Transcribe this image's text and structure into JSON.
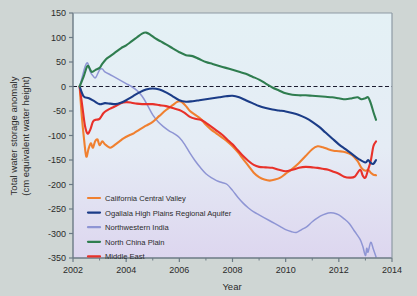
{
  "chart_data": {
    "type": "line",
    "title": "",
    "xlabel": "Year",
    "ylabel": "Total water storage anomaly (cm equivalent water height)",
    "ylabel_line1": "Total water storage anomaly",
    "ylabel_line2": "(cm equivalent water height)",
    "xlim": [
      2002,
      2014
    ],
    "ylim": [
      -350,
      150
    ],
    "xticks": [
      2002,
      2004,
      2006,
      2008,
      2010,
      2012,
      2014
    ],
    "xtick_labels": [
      "2002",
      "2004",
      "2006",
      "2008",
      "2010",
      "2012",
      "2014"
    ],
    "yticks": [
      150,
      100,
      50,
      0,
      -50,
      -100,
      -150,
      -200,
      -250,
      -300,
      -350
    ],
    "ytick_labels": [
      "150",
      "100",
      "50",
      "0",
      "-50",
      "-100",
      "-150",
      "-200",
      "-250",
      "-300",
      "-350"
    ],
    "grid": false,
    "zero_reference_line": {
      "value": 0,
      "style": "dashed",
      "color": "#1a1a2e"
    },
    "legend_position": "lower-left-inside",
    "series": [
      {
        "name": "California Central Valley",
        "color": "#f08030",
        "x": [
          2002.25,
          2002.33,
          2002.42,
          2002.5,
          2002.58,
          2002.67,
          2002.75,
          2002.83,
          2002.92,
          2003.0,
          2003.1,
          2003.2,
          2003.3,
          2003.4,
          2003.5,
          2003.6,
          2003.75,
          2003.9,
          2004.1,
          2004.3,
          2004.5,
          2004.75,
          2005.0,
          2005.25,
          2005.5,
          2005.75,
          2005.9,
          2006.0,
          2006.1,
          2006.25,
          2006.4,
          2006.6,
          2006.8,
          2007.0,
          2007.2,
          2007.4,
          2007.6,
          2007.8,
          2008.0,
          2008.2,
          2008.4,
          2008.6,
          2008.8,
          2009.0,
          2009.2,
          2009.4,
          2009.6,
          2009.8,
          2010.0,
          2010.25,
          2010.5,
          2010.75,
          2011.0,
          2011.2,
          2011.4,
          2011.6,
          2011.8,
          2012.0,
          2012.25,
          2012.5,
          2012.7,
          2012.85,
          2013.0,
          2013.1,
          2013.2,
          2013.3,
          2013.4
        ],
        "y": [
          0,
          -60,
          -110,
          -143,
          -128,
          -116,
          -125,
          -112,
          -108,
          -120,
          -112,
          -118,
          -122,
          -125,
          -122,
          -118,
          -112,
          -106,
          -100,
          -95,
          -88,
          -80,
          -72,
          -60,
          -48,
          -38,
          -32,
          -30,
          -32,
          -40,
          -50,
          -58,
          -66,
          -78,
          -88,
          -96,
          -104,
          -112,
          -122,
          -134,
          -148,
          -162,
          -176,
          -185,
          -190,
          -192,
          -190,
          -186,
          -178,
          -168,
          -156,
          -142,
          -128,
          -122,
          -124,
          -128,
          -131,
          -132,
          -134,
          -140,
          -152,
          -166,
          -172,
          -170,
          -176,
          -180,
          -181
        ]
      },
      {
        "name": "Ogallala High Plains Regional Aquifer",
        "color": "#1b3c87",
        "x": [
          2002.25,
          2002.4,
          2002.6,
          2002.8,
          2003.0,
          2003.2,
          2003.4,
          2003.6,
          2003.8,
          2004.0,
          2004.25,
          2004.5,
          2004.75,
          2005.0,
          2005.25,
          2005.5,
          2005.75,
          2006.0,
          2006.25,
          2006.5,
          2006.75,
          2007.0,
          2007.25,
          2007.5,
          2007.75,
          2008.0,
          2008.25,
          2008.5,
          2008.75,
          2009.0,
          2009.25,
          2009.5,
          2009.75,
          2010.0,
          2010.25,
          2010.5,
          2010.75,
          2011.0,
          2011.25,
          2011.5,
          2011.75,
          2012.0,
          2012.25,
          2012.5,
          2012.75,
          2013.0,
          2013.1,
          2013.2,
          2013.3,
          2013.4
        ],
        "y": [
          0,
          -20,
          -24,
          -30,
          -36,
          -34,
          -35,
          -36,
          -33,
          -28,
          -20,
          -12,
          -6,
          -4,
          -6,
          -12,
          -20,
          -28,
          -31,
          -30,
          -28,
          -26,
          -24,
          -22,
          -20,
          -19,
          -22,
          -28,
          -34,
          -40,
          -44,
          -47,
          -49,
          -51,
          -54,
          -58,
          -64,
          -72,
          -82,
          -94,
          -106,
          -118,
          -128,
          -138,
          -148,
          -155,
          -150,
          -156,
          -158,
          -150
        ]
      },
      {
        "name": "Northwestern India",
        "color": "#8e95d4",
        "x": [
          2002.25,
          2002.35,
          2002.45,
          2002.55,
          2002.65,
          2002.75,
          2002.85,
          2003.0,
          2003.1,
          2003.2,
          2003.4,
          2003.6,
          2003.8,
          2004.0,
          2004.2,
          2004.4,
          2004.6,
          2004.8,
          2005.0,
          2005.2,
          2005.4,
          2005.6,
          2005.8,
          2006.0,
          2006.2,
          2006.4,
          2006.6,
          2006.8,
          2007.0,
          2007.2,
          2007.4,
          2007.6,
          2007.8,
          2008.0,
          2008.2,
          2008.4,
          2008.6,
          2008.8,
          2009.0,
          2009.2,
          2009.4,
          2009.6,
          2009.8,
          2010.0,
          2010.2,
          2010.4,
          2010.6,
          2010.8,
          2011.0,
          2011.2,
          2011.4,
          2011.6,
          2011.8,
          2012.0,
          2012.2,
          2012.4,
          2012.6,
          2012.8,
          2012.9,
          2013.0,
          2013.05,
          2013.1,
          2013.2,
          2013.3,
          2013.4
        ],
        "y": [
          0,
          20,
          40,
          48,
          30,
          22,
          18,
          34,
          36,
          30,
          24,
          18,
          12,
          6,
          0,
          -8,
          -20,
          -38,
          -58,
          -72,
          -82,
          -90,
          -96,
          -104,
          -118,
          -136,
          -152,
          -166,
          -178,
          -186,
          -192,
          -196,
          -200,
          -212,
          -226,
          -238,
          -248,
          -256,
          -262,
          -268,
          -274,
          -280,
          -286,
          -292,
          -296,
          -298,
          -292,
          -286,
          -276,
          -268,
          -262,
          -258,
          -258,
          -262,
          -270,
          -280,
          -296,
          -312,
          -326,
          -345,
          -330,
          -338,
          -318,
          -332,
          -348
        ]
      },
      {
        "name": "North China Plain",
        "color": "#2f7d4f",
        "x": [
          2002.25,
          2002.4,
          2002.55,
          2002.7,
          2002.85,
          2003.0,
          2003.1,
          2003.25,
          2003.4,
          2003.6,
          2003.8,
          2004.0,
          2004.2,
          2004.4,
          2004.6,
          2004.75,
          2004.9,
          2005.1,
          2005.3,
          2005.5,
          2005.75,
          2006.0,
          2006.25,
          2006.5,
          2006.75,
          2007.0,
          2007.25,
          2007.5,
          2007.75,
          2008.0,
          2008.25,
          2008.5,
          2008.75,
          2009.0,
          2009.25,
          2009.5,
          2009.75,
          2010.0,
          2010.25,
          2010.5,
          2010.75,
          2011.0,
          2011.25,
          2011.5,
          2011.75,
          2012.0,
          2012.25,
          2012.5,
          2012.7,
          2012.85,
          2013.0,
          2013.1,
          2013.2,
          2013.3,
          2013.4
        ],
        "y": [
          0,
          20,
          42,
          30,
          34,
          38,
          46,
          56,
          62,
          70,
          78,
          84,
          92,
          100,
          108,
          110,
          106,
          98,
          92,
          86,
          78,
          70,
          64,
          62,
          56,
          50,
          46,
          42,
          38,
          34,
          30,
          26,
          20,
          14,
          6,
          -2,
          -8,
          -14,
          -17,
          -18,
          -18,
          -19,
          -20,
          -21,
          -22,
          -24,
          -26,
          -24,
          -22,
          -26,
          -24,
          -22,
          -34,
          -52,
          -68
        ]
      },
      {
        "name": "Middle East",
        "color": "#e8312a",
        "x": [
          2002.25,
          2002.35,
          2002.45,
          2002.55,
          2002.65,
          2002.75,
          2002.85,
          2003.0,
          2003.15,
          2003.3,
          2003.45,
          2003.6,
          2003.8,
          2004.0,
          2004.2,
          2004.4,
          2004.6,
          2004.8,
          2005.0,
          2005.25,
          2005.5,
          2005.75,
          2006.0,
          2006.2,
          2006.4,
          2006.6,
          2006.8,
          2007.0,
          2007.2,
          2007.4,
          2007.6,
          2007.8,
          2008.0,
          2008.2,
          2008.4,
          2008.6,
          2008.8,
          2009.0,
          2009.25,
          2009.5,
          2009.75,
          2010.0,
          2010.25,
          2010.5,
          2010.75,
          2011.0,
          2011.2,
          2011.4,
          2011.6,
          2011.8,
          2012.0,
          2012.2,
          2012.4,
          2012.6,
          2012.8,
          2012.9,
          2013.0,
          2013.1,
          2013.2,
          2013.3,
          2013.4
        ],
        "y": [
          0,
          -40,
          -80,
          -96,
          -88,
          -72,
          -68,
          -66,
          -54,
          -48,
          -44,
          -40,
          -34,
          -32,
          -33,
          -35,
          -36,
          -36,
          -36,
          -38,
          -40,
          -44,
          -48,
          -54,
          -62,
          -66,
          -68,
          -74,
          -82,
          -90,
          -98,
          -108,
          -118,
          -130,
          -142,
          -152,
          -160,
          -164,
          -165,
          -166,
          -170,
          -173,
          -170,
          -166,
          -164,
          -165,
          -166,
          -168,
          -170,
          -174,
          -178,
          -184,
          -186,
          -184,
          -170,
          -182,
          -186,
          -170,
          -152,
          -122,
          -112
        ]
      }
    ]
  },
  "legend": {
    "items": [
      {
        "label": "California Central Valley",
        "color": "#f08030"
      },
      {
        "label": "Ogallala High Plains Regional Aquifer",
        "color": "#1b3c87"
      },
      {
        "label": "Northwestern India",
        "color": "#8e95d4"
      },
      {
        "label": "North China Plain",
        "color": "#2f7d4f"
      },
      {
        "label": "Middle East",
        "color": "#e8312a"
      }
    ]
  },
  "style": {
    "page_background": "#cfd6d4",
    "plot_background_top": "#e2f0f4",
    "plot_background_bottom": "#ded8ee",
    "axis_color": "#6b7a85",
    "text_color": "#2b2b2b"
  }
}
